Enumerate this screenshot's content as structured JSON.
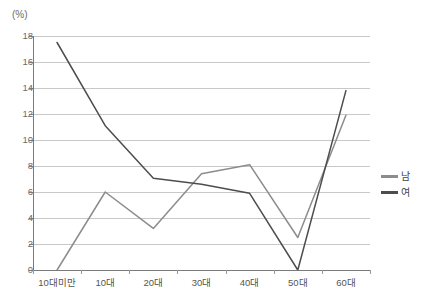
{
  "chart_data": {
    "type": "line",
    "title": "",
    "xlabel": "",
    "ylabel": "(%)",
    "categories": [
      "10대미만",
      "10대",
      "20대",
      "30대",
      "40대",
      "50대",
      "60대"
    ],
    "series": [
      {
        "name": "남",
        "color": "#8c8c8c",
        "values": [
          0,
          6.0,
          3.2,
          7.4,
          8.1,
          2.5,
          11.9
        ]
      },
      {
        "name": "여",
        "color": "#4d4d4d",
        "values": [
          17.5,
          11.1,
          7.05,
          6.6,
          5.9,
          0,
          13.8
        ]
      }
    ],
    "ylim": [
      0,
      18
    ],
    "ytick_step": 2,
    "yticks": [
      0,
      2,
      4,
      6,
      8,
      10,
      12,
      14,
      16,
      18
    ],
    "ytick_labels": [
      "0",
      "2",
      "4",
      "6",
      "8",
      "10",
      "12",
      "14",
      "16",
      "18"
    ],
    "grid": true,
    "grid_axis": "y",
    "grid_color": "#c8c8c8",
    "legend_position": "right",
    "axis_color": "#7a7a7a",
    "background": "#ffffff"
  },
  "legend": {
    "items": [
      {
        "label": "남",
        "color": "#8c8c8c"
      },
      {
        "label": "여",
        "color": "#4d4d4d"
      }
    ]
  },
  "axes": {
    "y_unit": "(%)"
  }
}
